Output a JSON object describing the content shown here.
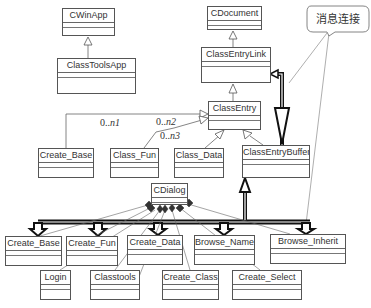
{
  "diagram": {
    "type": "uml-class-diagram",
    "classes": [
      {
        "id": "cwinapp",
        "name": "CWinApp",
        "x": 62,
        "y": 8,
        "w": 53,
        "h": 28
      },
      {
        "id": "classtoolsapp",
        "name": "ClassToolsApp",
        "x": 57,
        "y": 58,
        "w": 79,
        "h": 36
      },
      {
        "id": "cdocument",
        "name": "CDocument",
        "x": 207,
        "y": 6,
        "w": 55,
        "h": 24
      },
      {
        "id": "classentrylink",
        "name": "ClassEntryLink",
        "x": 201,
        "y": 47,
        "w": 70,
        "h": 36
      },
      {
        "id": "classentry",
        "name": "ClassEntry",
        "x": 208,
        "y": 101,
        "w": 53,
        "h": 29
      },
      {
        "id": "create_base_top",
        "name": "Create_Base",
        "x": 38,
        "y": 148,
        "w": 56,
        "h": 30
      },
      {
        "id": "class_fun",
        "name": "Class_Fun",
        "x": 110,
        "y": 148,
        "w": 49,
        "h": 30
      },
      {
        "id": "class_data",
        "name": "Class_Data",
        "x": 174,
        "y": 148,
        "w": 50,
        "h": 30
      },
      {
        "id": "classentrybuffer",
        "name": "ClassEntryBuffer",
        "x": 242,
        "y": 145,
        "w": 68,
        "h": 33
      },
      {
        "id": "cdialog",
        "name": "CDialog",
        "x": 151,
        "y": 183,
        "w": 37,
        "h": 22
      },
      {
        "id": "create_base",
        "name": "Create_Base",
        "x": 5,
        "y": 236,
        "w": 57,
        "h": 30
      },
      {
        "id": "create_fun",
        "name": "Create_Fun",
        "x": 66,
        "y": 236,
        "w": 52,
        "h": 30
      },
      {
        "id": "create_data",
        "name": "Create_Data",
        "x": 127,
        "y": 235,
        "w": 56,
        "h": 30
      },
      {
        "id": "browse_name",
        "name": "Browse_Name",
        "x": 194,
        "y": 235,
        "w": 61,
        "h": 30
      },
      {
        "id": "browse_inherit",
        "name": "Browse_Inherit",
        "x": 270,
        "y": 234,
        "w": 76,
        "h": 30
      },
      {
        "id": "login",
        "name": "Login",
        "x": 40,
        "y": 270,
        "w": 31,
        "h": 30
      },
      {
        "id": "classtools",
        "name": "Classtools",
        "x": 90,
        "y": 270,
        "w": 50,
        "h": 30
      },
      {
        "id": "create_class",
        "name": "Create_Class",
        "x": 162,
        "y": 270,
        "w": 57,
        "h": 30
      },
      {
        "id": "create_select",
        "name": "Create_Select",
        "x": 232,
        "y": 270,
        "w": 70,
        "h": 30
      }
    ],
    "multiplicities": [
      {
        "label": "0..",
        "italic": "n1",
        "x": 100,
        "y": 125
      },
      {
        "label": "0..",
        "italic": "n2",
        "x": 156,
        "y": 124
      },
      {
        "label": "0..",
        "italic": "n3",
        "x": 160,
        "y": 134
      }
    ],
    "callout": {
      "text": "消息连接",
      "x": 307,
      "y": 6,
      "w": 62,
      "h": 28
    }
  }
}
